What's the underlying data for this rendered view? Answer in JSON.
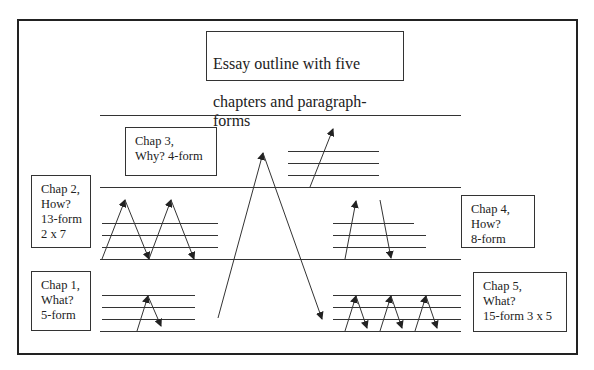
{
  "diagram": {
    "title": "Essay outline with five chapters and paragraph-forms",
    "title_lines": [
      "Essay outline with five",
      "chapters and paragraph-forms"
    ],
    "chapters": [
      {
        "id": "chap1",
        "text": "Chap 1,\nWhat?\n5-form",
        "label": "Chap 1,",
        "question": "What?",
        "form": "5-form"
      },
      {
        "id": "chap2",
        "text": "Chap 2,\nHow?\n13-form\n2 x 7",
        "label": "Chap 2,",
        "question": "How?",
        "form": "13-form",
        "breakdown": "2 x 7"
      },
      {
        "id": "chap3",
        "text": "Chap 3,\nWhy?  4-form",
        "label": "Chap 3,",
        "question": "Why?",
        "form": "4-form"
      },
      {
        "id": "chap4",
        "text": "Chap 4,\n How?\n8-form",
        "label": "Chap 4,",
        "question": "How?",
        "form": "8-form"
      },
      {
        "id": "chap5",
        "text": "Chap 5,\nWhat?\n15-form 3 x 5",
        "label": "Chap 5,",
        "question": "What?",
        "form": "15-form",
        "breakdown": "3 x 5"
      }
    ],
    "colors": {
      "line": "#333333",
      "frame": "#222222",
      "background": "#ffffff"
    }
  }
}
